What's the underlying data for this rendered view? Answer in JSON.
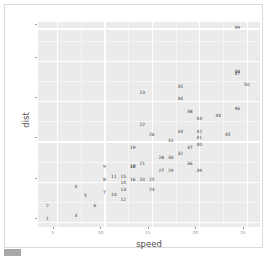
{
  "chart_data": {
    "type": "scatter",
    "title": "",
    "xlabel": "speed",
    "ylabel": "dist",
    "xlim": [
      3.0,
      26.4
    ],
    "ylim": [
      -3.0,
      124.0
    ],
    "grid": true,
    "legend": null,
    "x_ticks": [
      5,
      10,
      15,
      20,
      25
    ],
    "y_ticks": [
      0,
      25,
      50,
      75,
      100,
      120
    ],
    "x_tick_labels": [
      "5",
      "10",
      "15",
      "20",
      "25"
    ],
    "y_tick_labels": [
      "0",
      "25",
      "50",
      "75",
      "100",
      "120"
    ],
    "x_minor_ticks": [
      7.5,
      12.5,
      17.5,
      22.5
    ],
    "y_minor_ticks": [
      12.5,
      37.5,
      62.5,
      87.5,
      112.5
    ],
    "point_label_field": "index",
    "points": [
      {
        "label": "1",
        "x": 4,
        "y": 2
      },
      {
        "label": "2",
        "x": 4,
        "y": 10
      },
      {
        "label": "3",
        "x": 7,
        "y": 4
      },
      {
        "label": "4",
        "x": 7,
        "y": 22
      },
      {
        "label": "5",
        "x": 8,
        "y": 16
      },
      {
        "label": "6",
        "x": 9,
        "y": 10
      },
      {
        "label": "7",
        "x": 10,
        "y": 18
      },
      {
        "label": "8",
        "x": 10,
        "y": 26
      },
      {
        "label": "9",
        "x": 10,
        "y": 34
      },
      {
        "label": "10",
        "x": 11,
        "y": 17
      },
      {
        "label": "11",
        "x": 11,
        "y": 28
      },
      {
        "label": "12",
        "x": 12,
        "y": 14
      },
      {
        "label": "13",
        "x": 12,
        "y": 20
      },
      {
        "label": "14",
        "x": 12,
        "y": 24
      },
      {
        "label": "15",
        "x": 12,
        "y": 28
      },
      {
        "label": "16",
        "x": 13,
        "y": 26
      },
      {
        "label": "17",
        "x": 13,
        "y": 34
      },
      {
        "label": "18",
        "x": 13,
        "y": 34
      },
      {
        "label": "19",
        "x": 13,
        "y": 46
      },
      {
        "label": "20",
        "x": 14,
        "y": 26
      },
      {
        "label": "21",
        "x": 14,
        "y": 36
      },
      {
        "label": "22",
        "x": 14,
        "y": 60
      },
      {
        "label": "23",
        "x": 14,
        "y": 80
      },
      {
        "label": "24",
        "x": 15,
        "y": 20
      },
      {
        "label": "25",
        "x": 15,
        "y": 26
      },
      {
        "label": "26",
        "x": 15,
        "y": 54
      },
      {
        "label": "27",
        "x": 16,
        "y": 32
      },
      {
        "label": "28",
        "x": 16,
        "y": 40
      },
      {
        "label": "29",
        "x": 17,
        "y": 32
      },
      {
        "label": "30",
        "x": 17,
        "y": 40
      },
      {
        "label": "31",
        "x": 17,
        "y": 50
      },
      {
        "label": "32",
        "x": 18,
        "y": 42
      },
      {
        "label": "33",
        "x": 18,
        "y": 56
      },
      {
        "label": "34",
        "x": 18,
        "y": 76
      },
      {
        "label": "35",
        "x": 18,
        "y": 84
      },
      {
        "label": "36",
        "x": 19,
        "y": 36
      },
      {
        "label": "37",
        "x": 19,
        "y": 46
      },
      {
        "label": "38",
        "x": 19,
        "y": 68
      },
      {
        "label": "39",
        "x": 20,
        "y": 32
      },
      {
        "label": "40",
        "x": 20,
        "y": 48
      },
      {
        "label": "41",
        "x": 20,
        "y": 52
      },
      {
        "label": "42",
        "x": 20,
        "y": 56
      },
      {
        "label": "43",
        "x": 20,
        "y": 64
      },
      {
        "label": "44",
        "x": 22,
        "y": 66
      },
      {
        "label": "45",
        "x": 23,
        "y": 54
      },
      {
        "label": "46",
        "x": 24,
        "y": 70
      },
      {
        "label": "47",
        "x": 24,
        "y": 92
      },
      {
        "label": "48",
        "x": 24,
        "y": 93
      },
      {
        "label": "49",
        "x": 24,
        "y": 120
      },
      {
        "label": "50",
        "x": 25,
        "y": 85
      }
    ]
  },
  "theme": {
    "panel_background": "#ebebeb",
    "grid_major_color": "#ffffff",
    "grid_minor_color": "#f5f5f5",
    "label_color": "#3a3a3a",
    "axis_text_color": "#8c8c8c",
    "axis_title_color": "#4d4d4d",
    "page_background": "#ffffff"
  }
}
